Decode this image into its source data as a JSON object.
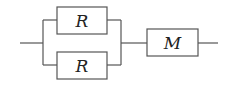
{
  "diagram": {
    "type": "circuit-block-diagram",
    "components": [
      {
        "id": "r1",
        "label": "R",
        "position": "top-parallel-branch"
      },
      {
        "id": "r2",
        "label": "R",
        "position": "bottom-parallel-branch"
      },
      {
        "id": "m",
        "label": "M",
        "position": "series-after-parallel"
      }
    ],
    "colors": {
      "line": "#555555",
      "text": "#222222",
      "background": "#ffffff"
    }
  }
}
